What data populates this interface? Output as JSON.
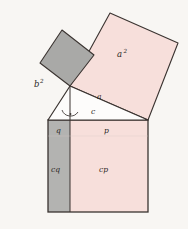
{
  "figure": {
    "background_color": "#f8f6f3",
    "stroke_color": "#3a3330",
    "pink_fill": "#f7dfdb",
    "gray_fill": "#a9a9a7",
    "gray_fill_light": "#b3b3b1",
    "white_fill": "#fdfcfb"
  },
  "labels": {
    "a_square": {
      "base": "a",
      "exp": "2"
    },
    "b_square": {
      "base": "b",
      "exp": "2"
    },
    "side_a": "a",
    "side_c": "c",
    "segment_q": "q",
    "segment_p": "p",
    "rect_cq": "cq",
    "rect_cp": "cp"
  },
  "shapes": {
    "a_square_points": "70,86 110,13 178,43 148,120",
    "b_square_points": "70,86 40,63 62,30 94,55",
    "triangle_points": "70,86 148,120 48,120",
    "bottom_square_points": "48,120 148,120 148,212 48,212",
    "altitude_line": {
      "x1": 70,
      "y1": 86,
      "x2": 70,
      "y2": 212
    },
    "divider_x": 70,
    "inner_divider_y": 136
  },
  "markers": {
    "right_angle_arc": "arc-with-dot"
  }
}
